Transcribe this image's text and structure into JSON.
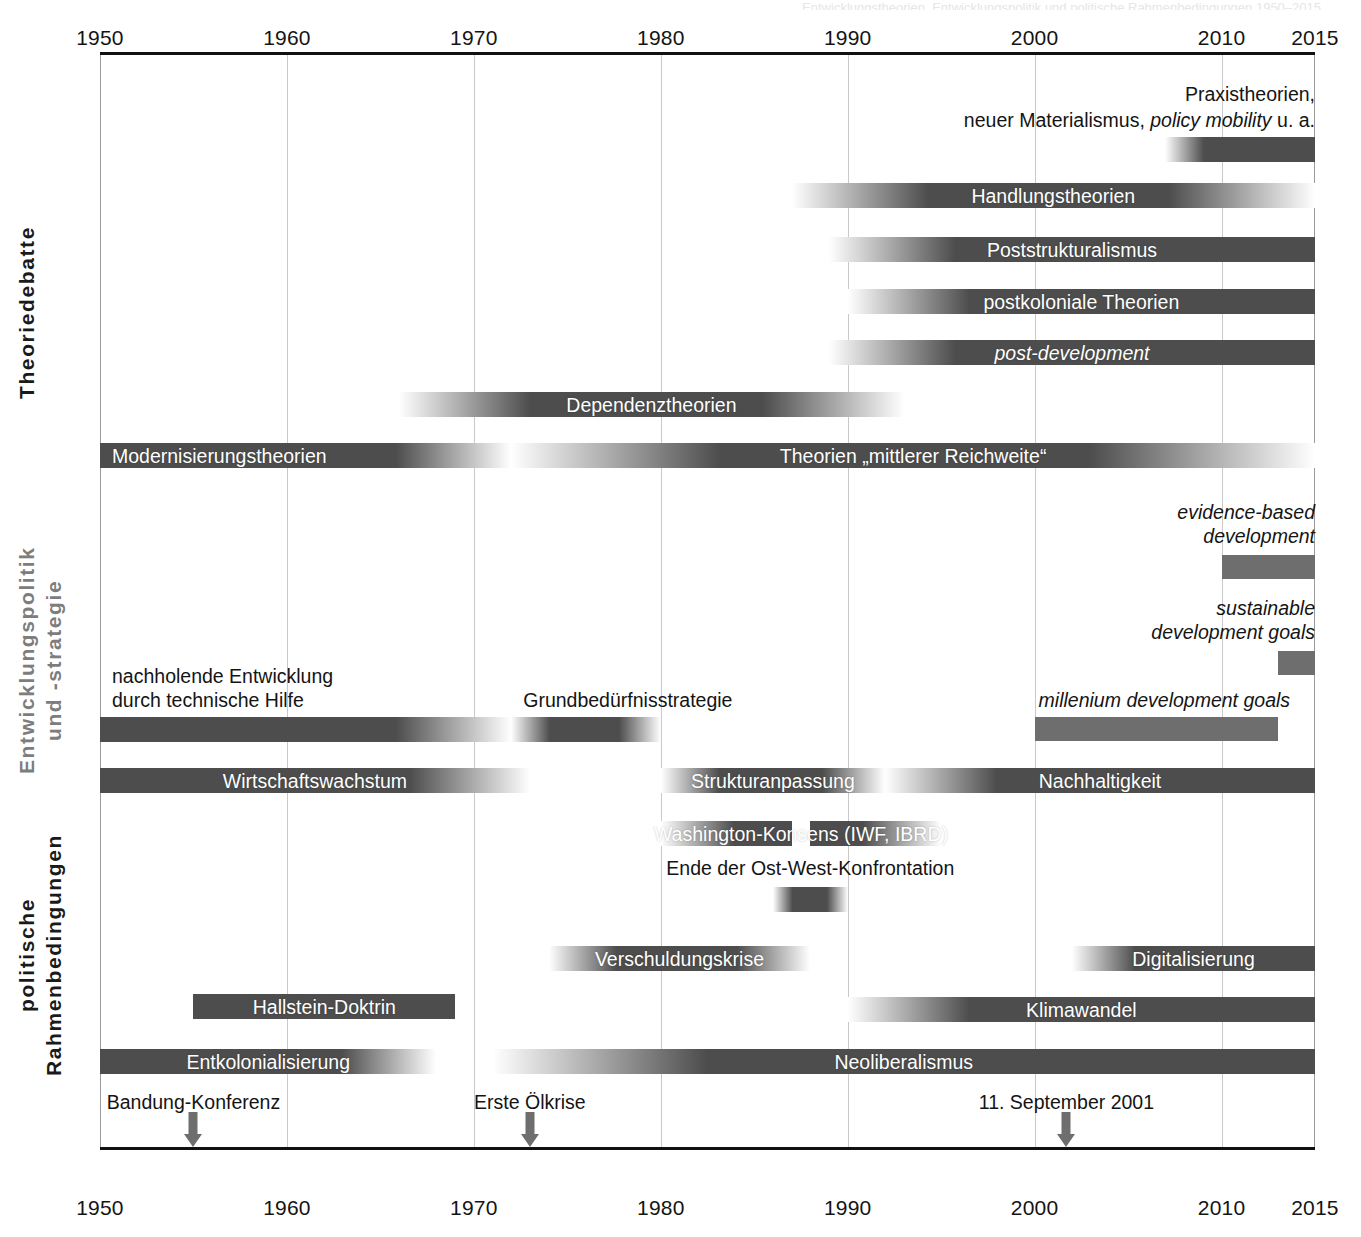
{
  "chart_data": {
    "type": "bar",
    "title": "Entwicklungstheorien, Entwicklungspolitik und politische Rahmenbedingungen 1950–2015",
    "subtype": "timeline / gantt",
    "xlabel": "",
    "ylabel": "",
    "xlim": [
      1950,
      2015
    ],
    "grid": true,
    "legend": "none",
    "axis": {
      "ticks": [
        1950,
        1960,
        1970,
        1980,
        1990,
        2000,
        2010,
        2015
      ],
      "tick_labels": [
        "1950",
        "1960",
        "1970",
        "1980",
        "1990",
        "2000",
        "2010",
        "2015"
      ],
      "top_labels": [
        "1950",
        "1960",
        "1970",
        "1980",
        "1990",
        "2000",
        "2010",
        "2015"
      ],
      "bottom_labels": [
        "1950",
        "1960",
        "1970",
        "1980",
        "1990",
        "2000",
        "2010",
        "2015"
      ]
    },
    "sections": [
      {
        "id": "theoriedebatte",
        "label": "Theoriedebatte",
        "label_color": "#1a1a1a",
        "bars": [
          {
            "name": "Praxistheorien, neuer Materialismus, policy mobility u. a.",
            "start": 2007,
            "end": 2015,
            "fade_left": true,
            "fade_right": false,
            "label_inside": false
          },
          {
            "name": "Handlungstheorien",
            "start": 1987,
            "end": 2015,
            "fade_left": true,
            "fade_right": true,
            "label_inside": true,
            "label_pos": "center"
          },
          {
            "name": "Poststrukturalismus",
            "start": 1989,
            "end": 2015,
            "fade_left": true,
            "fade_right": false,
            "label_inside": true,
            "label_pos": "center"
          },
          {
            "name": "postkoloniale Theorien",
            "start": 1990,
            "end": 2015,
            "fade_left": true,
            "fade_right": false,
            "label_inside": true,
            "label_pos": "center"
          },
          {
            "name": "post-development",
            "start": 1989,
            "end": 2015,
            "fade_left": true,
            "fade_right": false,
            "italic": true,
            "label_inside": true,
            "label_pos": "center"
          },
          {
            "name": "Dependenztheorien",
            "start": 1966,
            "end": 1993,
            "fade_left": true,
            "fade_right": true,
            "label_inside": true,
            "label_pos": "center"
          },
          {
            "name": "Modernisierungstheorien",
            "start": 1950,
            "end": 1972,
            "fade_left": false,
            "fade_right": true,
            "label_inside": true,
            "label_pos": "left"
          },
          {
            "name": "Theorien „mittlerer Reichweite“",
            "start": 1972,
            "end": 2015,
            "fade_left": true,
            "fade_right": true,
            "label_inside": true,
            "label_pos": "center"
          }
        ]
      },
      {
        "id": "entwicklungspolitik",
        "label": "Entwicklungspolitik\nund -strategie",
        "label_color": "#7d7d7d",
        "bars": [
          {
            "name": "evidence-based development",
            "start": 2010,
            "end": 2015,
            "fade_left": false,
            "fade_right": false,
            "italic": true,
            "label_inside": false,
            "label_lines": [
              "evidence-based",
              "development"
            ]
          },
          {
            "name": "sustainable development goals",
            "start": 2013,
            "end": 2015,
            "fade_left": false,
            "fade_right": false,
            "italic": true,
            "label_inside": false,
            "label_lines": [
              "sustainable",
              "development goals"
            ]
          },
          {
            "name": "millenium development goals",
            "start": 2000,
            "end": 2013,
            "fade_left": false,
            "fade_right": false,
            "italic": true,
            "label_inside": false,
            "label_lines": [
              "millenium development goals"
            ]
          },
          {
            "name": "nachholende Entwicklung durch technische Hilfe",
            "start": 1950,
            "end": 1972,
            "fade_left": false,
            "fade_right": true,
            "label_inside": false,
            "label_lines": [
              "nachholende Entwicklung",
              "durch technische Hilfe"
            ]
          },
          {
            "name": "Grundbedürfnisstrategie",
            "start": 1972,
            "end": 1980,
            "fade_left": true,
            "fade_right": true,
            "label_inside": false,
            "label_lines": [
              "Grundbedürfnisstrategie"
            ]
          },
          {
            "name": "Wirtschaftswachstum",
            "start": 1950,
            "end": 1973,
            "fade_left": false,
            "fade_right": true,
            "label_inside": true,
            "label_pos": "center"
          },
          {
            "name": "Strukturanpassung",
            "start": 1980,
            "end": 1992,
            "fade_left": true,
            "fade_right": true,
            "label_inside": true,
            "label_pos": "center"
          },
          {
            "name": "Nachhaltigkeit",
            "start": 1992,
            "end": 2015,
            "fade_left": true,
            "fade_right": false,
            "label_inside": true,
            "label_pos": "center"
          },
          {
            "name": "Washington-Konsens (IWF, IBRD)",
            "start": 1980,
            "end": 1995,
            "fade_left": true,
            "fade_right": true,
            "notch": {
              "start": 1987,
              "end": 1988
            },
            "label_inside": true,
            "label_pos": "center"
          }
        ]
      },
      {
        "id": "rahmenbedingungen",
        "label": "politische\nRahmenbedingungen",
        "label_color": "#1a1a1a",
        "bars": [
          {
            "name": "Ende der Ost-West-Konfrontation",
            "start": 1986,
            "end": 1990,
            "fade_left": true,
            "fade_right": true,
            "label_inside": false,
            "label_lines": [
              "Ende der Ost-West-Konfrontation"
            ]
          },
          {
            "name": "Verschuldungskrise",
            "start": 1974,
            "end": 1988,
            "fade_left": true,
            "fade_right": true,
            "label_inside": true,
            "label_pos": "center"
          },
          {
            "name": "Digitalisierung",
            "start": 2002,
            "end": 2015,
            "fade_left": true,
            "fade_right": false,
            "label_inside": true,
            "label_pos": "center"
          },
          {
            "name": "Klimawandel",
            "start": 1990,
            "end": 2015,
            "fade_left": true,
            "fade_right": false,
            "label_inside": true,
            "label_pos": "center"
          },
          {
            "name": "Hallstein-Doktrin",
            "start": 1955,
            "end": 1969,
            "fade_left": false,
            "fade_right": false,
            "label_inside": true,
            "label_pos": "center"
          },
          {
            "name": "Entkolonialisierung",
            "start": 1950,
            "end": 1968,
            "fade_left": false,
            "fade_right": true,
            "label_inside": true,
            "label_pos": "center"
          },
          {
            "name": "Neoliberalismus",
            "start": 1971,
            "end": 2015,
            "fade_left": true,
            "fade_right": false,
            "label_inside": true,
            "label_pos": "center"
          }
        ]
      }
    ],
    "events": [
      {
        "label": "Bandung-Konferenz",
        "year": 1955
      },
      {
        "label": "Erste Ölkrise",
        "year": 1973
      },
      {
        "label": "11. September 2001",
        "year": 2001.7
      }
    ],
    "colors": {
      "bar_dark": "#4d4d4d",
      "bar_mid": "#6e6e6e",
      "bar_light": "#9a9a9a",
      "grid": "#c9c9c9",
      "axis": "#111111",
      "label_light": "#7d7d7d",
      "text": "#141414",
      "bar_text": "#ffffff"
    }
  }
}
